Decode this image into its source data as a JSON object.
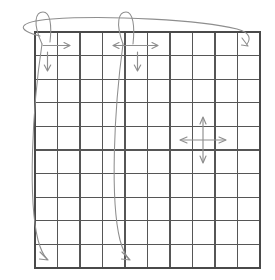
{
  "figure": {
    "background_color": "#ffffff",
    "width": 275,
    "height": 280
  },
  "grid": {
    "name": "ten-by-ten-grid",
    "columns": 10,
    "rows": 10,
    "left": 35,
    "top": 32,
    "right": 260,
    "bottom": 268,
    "cell_width": 22.5,
    "cell_height": 23.6,
    "line_color": "#565656",
    "border_color": "#4a4a4a"
  },
  "annotations": {
    "color": "#8e8e8e",
    "items": [
      {
        "id": "top-wide-ellipse",
        "label": "wide-horizontal-ellipse-loop",
        "type": "ellipse-loop",
        "description": "Long flat ellipse sweeping across the top of the grid ending in a down-right arrowhead near the top-right corner"
      },
      {
        "id": "left-narrow-loop",
        "label": "left-narrow-vertical-loop",
        "type": "loop",
        "description": "Narrow tall loop starting above the top-left corner and descending to the bottom-left cell"
      },
      {
        "id": "left-long-descend",
        "label": "left-long-descending-curve",
        "type": "curve-arrow",
        "description": "Curve descending the left side terminating with a down-right arrowhead in the bottom-left cell"
      },
      {
        "id": "mid-narrow-loop",
        "label": "middle-narrow-vertical-loop",
        "type": "loop",
        "description": "Narrow tall loop starting above column five descending to the bottom of the grid"
      },
      {
        "id": "mid-long-descend",
        "label": "middle-long-descending-curve",
        "type": "curve-arrow",
        "description": "Curve descending through the middle columns ending with a down-right arrowhead near the bottom"
      },
      {
        "id": "arrow-right-topleft",
        "label": "right-arrow-top-left",
        "type": "arrow",
        "direction": "right"
      },
      {
        "id": "arrow-down-topleft",
        "label": "down-arrow-top-left",
        "type": "arrow",
        "direction": "down"
      },
      {
        "id": "arrow-horizontal-double-top",
        "label": "double-headed-horizontal-arrow-top",
        "type": "double-arrow",
        "direction": "horizontal"
      },
      {
        "id": "arrow-down-topmid",
        "label": "down-arrow-top-middle",
        "type": "arrow",
        "direction": "down"
      },
      {
        "id": "arrow-topright-head",
        "label": "down-right-arrowhead-top-right",
        "type": "arrowhead",
        "direction": "down-right"
      },
      {
        "id": "cross-four-way",
        "label": "four-way-cross-arrow",
        "type": "cross-arrow",
        "direction": "all",
        "center_x": 203,
        "center_y": 140
      }
    ]
  }
}
